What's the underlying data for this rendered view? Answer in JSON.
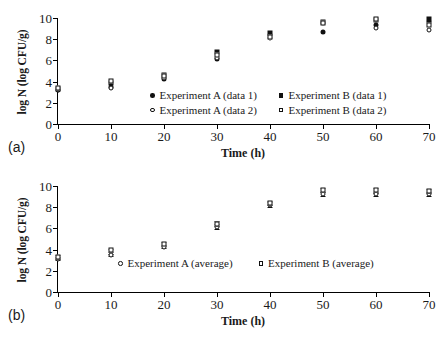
{
  "figure": {
    "panels": [
      {
        "id": "a",
        "label": "(a)",
        "xlabel": "Time (h)",
        "ylabel": "log N (log CFU/g)",
        "legend": [
          {
            "marker": "filled-circle",
            "label": "Experiment A (data 1)"
          },
          {
            "marker": "filled-square",
            "label": "Experiment B (data 1)"
          },
          {
            "marker": "open-circle",
            "label": "Experiment A (data 2)"
          },
          {
            "marker": "open-square",
            "label": "Experiment B (data 2)"
          }
        ]
      },
      {
        "id": "b",
        "label": "(b)",
        "xlabel": "Time (h)",
        "ylabel": "log N (log CFU/g)",
        "legend": [
          {
            "marker": "open-circle",
            "label": "Experiment A (average)"
          },
          {
            "marker": "open-square",
            "label": "Experiment B (average)"
          }
        ]
      }
    ],
    "xticks": [
      "0",
      "10",
      "20",
      "30",
      "40",
      "50",
      "60",
      "70"
    ],
    "yticks": [
      "0",
      "2",
      "4",
      "6",
      "8",
      "10"
    ]
  },
  "chart_data": [
    {
      "type": "scatter",
      "panel": "a",
      "title": "",
      "xlabel": "Time (h)",
      "ylabel": "log N (log CFU/g)",
      "xlim": [
        0,
        70
      ],
      "ylim": [
        0,
        10
      ],
      "xticks": [
        0,
        10,
        20,
        30,
        40,
        50,
        60,
        70
      ],
      "yticks": [
        0,
        2,
        4,
        6,
        8,
        10
      ],
      "grid": false,
      "legend_position": "inside-center",
      "x": [
        0,
        10,
        20,
        30,
        40,
        50,
        60,
        70
      ],
      "series": [
        {
          "name": "Experiment A (data 1)",
          "marker": "filled-circle",
          "values": [
            3.2,
            3.5,
            4.2,
            6.1,
            8.4,
            8.7,
            9.3,
            9.6
          ]
        },
        {
          "name": "Experiment A (data 2)",
          "marker": "open-circle",
          "values": [
            3.2,
            3.4,
            4.3,
            6.2,
            8.1,
            9.5,
            9.1,
            8.9
          ]
        },
        {
          "name": "Experiment B (data 1)",
          "marker": "filled-square",
          "values": [
            3.3,
            3.9,
            4.6,
            6.8,
            8.6,
            9.6,
            9.8,
            9.9
          ]
        },
        {
          "name": "Experiment B (data 2)",
          "marker": "open-square",
          "values": [
            3.4,
            4.1,
            4.5,
            6.5,
            8.2,
            9.5,
            9.9,
            9.3
          ]
        }
      ]
    },
    {
      "type": "scatter",
      "panel": "b",
      "title": "",
      "xlabel": "Time (h)",
      "ylabel": "log N (log CFU/g)",
      "xlim": [
        0,
        70
      ],
      "ylim": [
        0,
        10
      ],
      "xticks": [
        0,
        10,
        20,
        30,
        40,
        50,
        60,
        70
      ],
      "yticks": [
        0,
        2,
        4,
        6,
        8,
        10
      ],
      "grid": false,
      "legend_position": "inside-center",
      "x": [
        0,
        10,
        20,
        30,
        40,
        50,
        60,
        70
      ],
      "series": [
        {
          "name": "Experiment A (average)",
          "marker": "open-circle",
          "values": [
            3.15,
            3.45,
            4.25,
            6.15,
            8.25,
            9.25,
            9.2,
            9.25
          ],
          "errors": [
            0.15,
            0.1,
            0.1,
            0.25,
            0.2,
            0.15,
            0.15,
            0.2
          ]
        },
        {
          "name": "Experiment B (average)",
          "marker": "open-square",
          "values": [
            3.3,
            3.95,
            4.55,
            6.45,
            8.4,
            9.6,
            9.6,
            9.5
          ],
          "errors": [
            0.15,
            0.15,
            0.15,
            0.25,
            0.2,
            0.2,
            0.2,
            0.2
          ]
        }
      ]
    }
  ]
}
